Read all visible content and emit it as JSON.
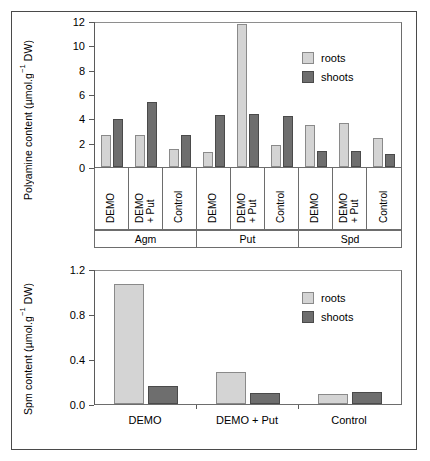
{
  "figure": {
    "background": "#ffffff",
    "frame_color": "#4a4a4a",
    "roots_color": "#d4d4d4",
    "shoots_color": "#6e6e6e"
  },
  "legend": {
    "roots_label": "roots",
    "shoots_label": "shoots"
  },
  "top": {
    "ylabel_prefix": "Polyamine content (µmol.g",
    "ylabel_sup": "−1",
    "ylabel_suffix": " DW)",
    "yticks": [
      "12",
      "10",
      "8",
      "6",
      "4",
      "2",
      "0"
    ],
    "treatments": [
      "DEMO",
      "DEMO\n+ Put",
      "Control",
      "DEMO",
      "DEMO\n+ Put",
      "Control",
      "DEMO",
      "DEMO\n+ Put",
      "Control"
    ],
    "groups": [
      "Agm",
      "Put",
      "Spd"
    ]
  },
  "bottom": {
    "ylabel_prefix": "Spm content (µmol.g",
    "ylabel_sup": "−1",
    "ylabel_suffix": " DW)",
    "yticks": [
      "1.2",
      "0.8",
      "0.4",
      "0.0"
    ],
    "xlabels": [
      "DEMO",
      "DEMO + Put",
      "Control"
    ]
  },
  "chart_data": [
    {
      "type": "bar",
      "id": "polyamine-content",
      "title": "",
      "xlabel": "",
      "ylabel": "Polyamine content (µmol.g⁻¹ DW)",
      "ylim": [
        0,
        12
      ],
      "yticks": [
        0,
        2,
        4,
        6,
        8,
        10,
        12
      ],
      "grid": false,
      "legend_position": "top-right",
      "group_labels": [
        "Agm",
        "Put",
        "Spd"
      ],
      "categories": [
        "Agm / DEMO",
        "Agm / DEMO + Put",
        "Agm / Control",
        "Put / DEMO",
        "Put / DEMO + Put",
        "Put / Control",
        "Spd / DEMO",
        "Spd / DEMO + Put",
        "Spd / Control"
      ],
      "series": [
        {
          "name": "roots",
          "color": "#d4d4d4",
          "values": [
            2.7,
            2.7,
            1.5,
            1.25,
            11.9,
            1.85,
            3.5,
            3.7,
            2.45
          ]
        },
        {
          "name": "shoots",
          "color": "#6e6e6e",
          "values": [
            4.0,
            5.45,
            2.7,
            4.35,
            4.4,
            4.25,
            1.3,
            1.3,
            1.05
          ]
        }
      ]
    },
    {
      "type": "bar",
      "id": "spm-content",
      "title": "",
      "xlabel": "",
      "ylabel": "Spm content (µmol.g⁻¹ DW)",
      "ylim": [
        0,
        1.2
      ],
      "yticks": [
        0.0,
        0.4,
        0.8,
        1.2
      ],
      "grid": false,
      "legend_position": "top-right",
      "categories": [
        "DEMO",
        "DEMO + Put",
        "Control"
      ],
      "series": [
        {
          "name": "roots",
          "color": "#d4d4d4",
          "values": [
            1.08,
            0.29,
            0.09
          ]
        },
        {
          "name": "shoots",
          "color": "#6e6e6e",
          "values": [
            0.165,
            0.095,
            0.11
          ]
        }
      ]
    }
  ]
}
